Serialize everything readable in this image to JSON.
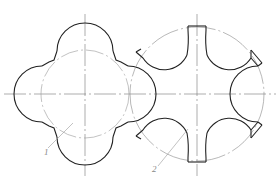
{
  "figure": {
    "parts": [
      {
        "id": "1",
        "label": "1",
        "name": "four-lobed wheel",
        "center": [
          85,
          94
        ],
        "pitch_radius": 44,
        "lobe_count": 4,
        "lobe_radius": 28
      },
      {
        "id": "2",
        "label": "2",
        "name": "six-slot disk",
        "center": [
          197,
          94
        ],
        "outer_radius": 67,
        "slot_count": 6,
        "slot_arc_radius": 25
      }
    ],
    "colors": {
      "outline": "#222222",
      "center_line": "#777777",
      "pitch_line": "#999999",
      "leader": "#999999",
      "label": "#888888"
    },
    "caption": ""
  }
}
